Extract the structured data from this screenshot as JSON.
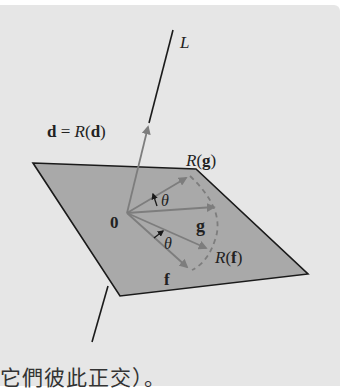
{
  "figure": {
    "colors": {
      "background": "#e6e6e6",
      "plane_fill": "#a9a9a9",
      "plane_edge": "#1a1a1a",
      "vector": "#7d7d7d",
      "axis_line": "#1a1a1a",
      "text": "#222222"
    },
    "labels": {
      "axis": "L",
      "d_bold": "d",
      "d_eq": " = ",
      "d_R": "R",
      "d_open": "(",
      "d_inner": "d",
      "d_close": ")",
      "Rg_R": "R",
      "Rg_open": "(",
      "Rg_inner": "g",
      "Rg_close": ")",
      "origin": "0",
      "g": "g",
      "Rf_R": "R",
      "Rf_open": "(",
      "Rf_inner": "f",
      "Rf_close": ")",
      "f": "f",
      "theta_top": "θ",
      "theta_bottom": "θ"
    }
  },
  "caption_fragment": "它們彼此正交）。"
}
